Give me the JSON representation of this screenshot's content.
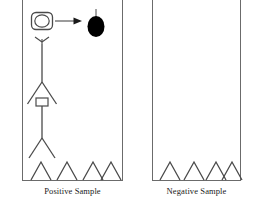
{
  "figure": {
    "width": 259,
    "height": 208,
    "background": "#ffffff",
    "stroke_color": "#4a4a4a",
    "frame_color": "#6b6b6b",
    "fill_color": "#000000"
  },
  "panels": [
    {
      "id": "positive",
      "caption": "Positive Sample",
      "has_target": true,
      "chevron_count": 4
    },
    {
      "id": "negative",
      "caption": "Negative Sample",
      "has_target": false,
      "chevron_count": 4
    }
  ],
  "elements": {
    "rounded_square_with_oval": "open-oval-in-rounded-square",
    "arrow_right": "right-arrow",
    "filled_ellipse": "filled-black-ellipse",
    "stem": "ellipse-stem",
    "down_arrowhead": "down-arrowhead",
    "vertical_stalk": "vertical-stalk",
    "upper_chevron": "upper-chevron",
    "small_rectangle": "small-rectangle-node",
    "lower_fork": "lower-fork",
    "ground_chevrons": "ground-chevron-row"
  }
}
